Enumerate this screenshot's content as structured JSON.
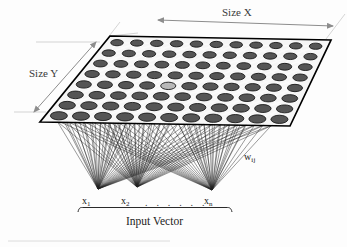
{
  "figure": {
    "background_color": "#fdfdfd"
  },
  "annotations": {
    "size_x": "Size X",
    "size_y": "Size Y",
    "weights": "w",
    "weights_subscript": "ij",
    "input_vector": "Input Vector",
    "x_first": "x",
    "x_first_subscript": "1",
    "x_second": "x",
    "x_second_subscript": "2",
    "x_last": "x",
    "x_last_subscript": "n",
    "ellipsis": ". . . . . ."
  },
  "colors": {
    "neuron_fill": "#555555",
    "neuron_stroke": "#1a1a1a",
    "lattice_link": "#f2f2f2",
    "map_plane_fill": "#f4f4f4",
    "map_plane_stroke": "#000000",
    "connection_line": "#111111",
    "dimension_arrow": "#8d8d8d",
    "text": "#1c1c1c",
    "background": "#fdfdfd"
  },
  "map_layer": {
    "label": "Kohonen output map lattice",
    "columns": 11,
    "rows": 8,
    "neuron_count": 88,
    "shape": "parallelogram-perspective-plane",
    "plane_corners": [
      [
        110,
        36
      ],
      [
        331,
        40
      ],
      [
        290,
        126
      ],
      [
        40,
        122
      ]
    ],
    "highlight_neuron": {
      "row": 4,
      "col": 4
    }
  },
  "input_layer": {
    "label": "Input vector nodes",
    "node_count": 3,
    "nodes": [
      {
        "name": "x1",
        "x": 98,
        "y": 189
      },
      {
        "name": "x2",
        "x": 137,
        "y": 187
      },
      {
        "name": "xn",
        "x": 212,
        "y": 190
      }
    ],
    "fan_links_per_node": 26
  },
  "dimension_arrows": {
    "size_x": {
      "x1": 158,
      "y1": 20,
      "x2": 333,
      "y2": 26
    },
    "size_y": {
      "x1": 96,
      "y1": 42,
      "x2": 34,
      "y2": 112
    }
  },
  "brace": {
    "left": 78,
    "right": 232,
    "y": 208
  }
}
